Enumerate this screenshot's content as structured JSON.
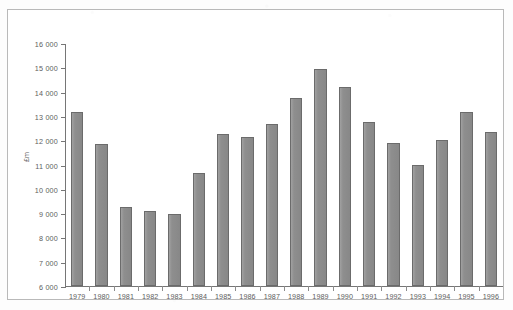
{
  "figure": {
    "background_color": "#ffffff",
    "frame_color": "#b9b9b9",
    "bar_fill_color": "#8c8c8c",
    "bar_edge_color": "#6b6b6b",
    "axis_color": "#767676",
    "text_color": "#5d5d5d"
  },
  "axis": {
    "y_title": "£m",
    "y_ticks": [
      "16 000",
      "15 000",
      "14 000",
      "13 000",
      "12 000",
      "11 000",
      "10 000",
      "9 000",
      "8 000",
      "7 000",
      "6 000"
    ]
  },
  "chart_data": {
    "type": "bar",
    "title": "",
    "subtitle": "",
    "xlabel": "",
    "ylabel": "£m",
    "ylim": [
      6000,
      16000
    ],
    "ytick_step": 1000,
    "grid": false,
    "legend": null,
    "categories": [
      "1979",
      "1980",
      "1981",
      "1982",
      "1983",
      "1984",
      "1985",
      "1986",
      "1987",
      "1988",
      "1989",
      "1990",
      "1991",
      "1992",
      "1993",
      "1994",
      "1995",
      "1996"
    ],
    "values": [
      13150,
      11850,
      9250,
      9100,
      8950,
      10650,
      12250,
      12150,
      12650,
      13750,
      14950,
      14200,
      12750,
      11900,
      11000,
      12000,
      13150,
      12350
    ]
  }
}
